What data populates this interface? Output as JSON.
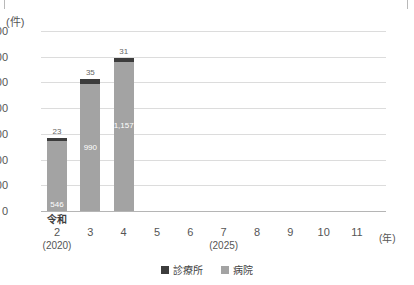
{
  "chart_data": {
    "type": "bar",
    "stacked": true,
    "title": "",
    "subtitle": "",
    "xlabel": "(年)",
    "ylabel": "(件)",
    "unit_label": "(件)",
    "x_unit_label": "(年)",
    "ylim": [
      0,
      1400
    ],
    "ytick_step": 200,
    "grid": true,
    "legend_position": "bottom",
    "categories": [
      "2",
      "3",
      "4",
      "5",
      "6",
      "7",
      "8",
      "9",
      "10",
      "11"
    ],
    "category_era_prefix": "令和",
    "category_western": {
      "2": "(2020)",
      "7": "(2025)"
    },
    "yticks": [
      "0",
      "200",
      "400",
      "600",
      "800",
      "1,000",
      "1,200",
      "1,400"
    ],
    "ytick_values": [
      0,
      200,
      400,
      600,
      800,
      1000,
      1200,
      1400
    ],
    "series": [
      {
        "name": "病院",
        "color": "#a3a3a3",
        "values": [
          546,
          990,
          1157,
          null,
          null,
          null,
          null,
          null,
          null,
          null
        ],
        "labels": [
          "546",
          "990",
          "1,157",
          "",
          "",
          "",
          "",
          "",
          "",
          ""
        ]
      },
      {
        "name": "診療所",
        "color": "#3c3c3c",
        "values": [
          23,
          35,
          31,
          null,
          null,
          null,
          null,
          null,
          null,
          null
        ],
        "labels": [
          "23",
          "35",
          "31",
          "",
          "",
          "",
          "",
          "",
          "",
          ""
        ]
      }
    ],
    "totals": [
      569,
      1025,
      1188,
      null,
      null,
      null,
      null,
      null,
      null,
      null
    ]
  },
  "legend": {
    "items": [
      {
        "label": "診療所",
        "color": "#3c3c3c"
      },
      {
        "label": "病院",
        "color": "#a3a3a3"
      }
    ]
  },
  "axis": {
    "y_unit": "(件)",
    "x_unit": "(年)",
    "era_label": "令和"
  }
}
